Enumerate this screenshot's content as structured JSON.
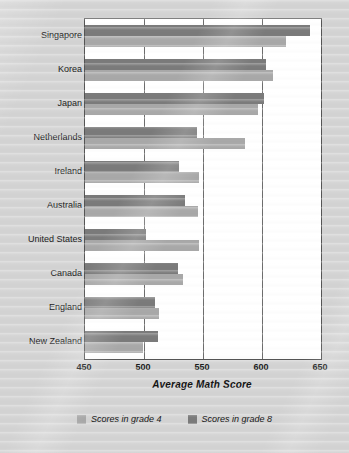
{
  "chart_data": {
    "type": "bar",
    "orientation": "horizontal",
    "title": "",
    "xlabel": "Average Math Score",
    "ylabel": "",
    "xlim": [
      450,
      650
    ],
    "xticks": [
      450,
      500,
      550,
      600,
      650
    ],
    "grid": true,
    "gridlines_at": [
      500,
      550,
      600
    ],
    "legend_position": "bottom",
    "categories": [
      "Singapore",
      "Korea",
      "Japan",
      "Netherlands",
      "Ireland",
      "Australia",
      "United States",
      "Canada",
      "England",
      "New Zealand"
    ],
    "series": [
      {
        "name": "Scores in grade 4",
        "color": "#a9a9a9",
        "values": [
          620,
          609,
          597,
          586,
          547,
          546,
          547,
          533,
          513,
          499
        ]
      },
      {
        "name": "Scores in grade 8",
        "color": "#7b7b7b",
        "values": [
          641,
          603,
          602,
          545,
          530,
          535,
          502,
          529,
          509,
          512
        ]
      }
    ]
  },
  "colors": {
    "grade4": "#a9a9a9",
    "grade8": "#7b7b7b",
    "plot_background": "#ffffff",
    "page_background": "#d4d4d4",
    "axis_line": "#555555",
    "gridline": "#6d6d6d",
    "text": "#1d1d1d"
  }
}
